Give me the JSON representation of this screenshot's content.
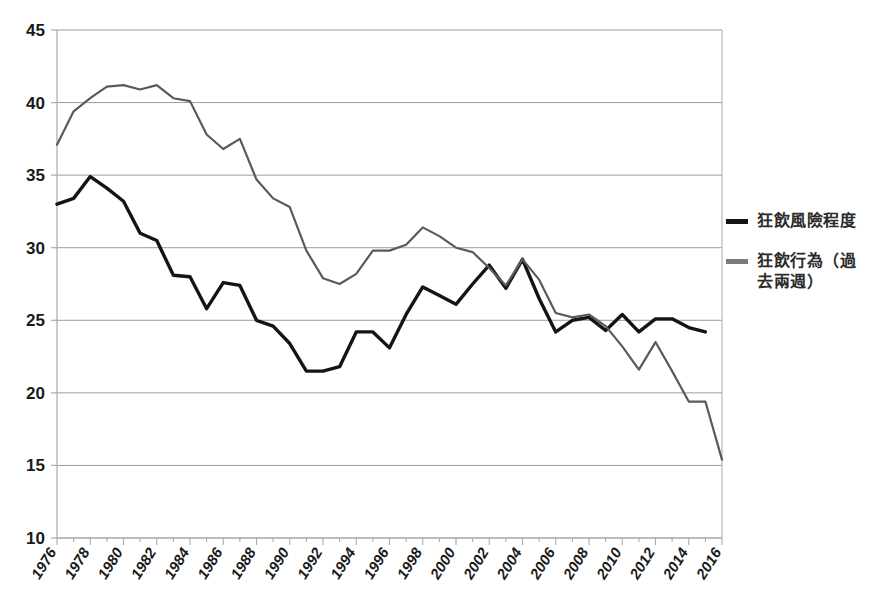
{
  "chart_data": {
    "type": "line",
    "title": "",
    "subtitle": "",
    "xlabel": "",
    "ylabel": "",
    "ylim": [
      10,
      45
    ],
    "ytick_step": 5,
    "yticks": [
      10,
      15,
      20,
      25,
      30,
      35,
      40,
      45
    ],
    "grid": true,
    "grid_axis": "y",
    "legend_position": "right",
    "x": [
      1976,
      1977,
      1978,
      1979,
      1980,
      1981,
      1982,
      1983,
      1984,
      1985,
      1986,
      1987,
      1988,
      1989,
      1990,
      1991,
      1992,
      1993,
      1994,
      1995,
      1996,
      1997,
      1998,
      1999,
      2000,
      2001,
      2002,
      2003,
      2004,
      2005,
      2006,
      2007,
      2008,
      2009,
      2010,
      2011,
      2012,
      2013,
      2014,
      2015,
      2016
    ],
    "xtick_labels": [
      "1976",
      "1978",
      "1980",
      "1982",
      "1984",
      "1986",
      "1988",
      "1990",
      "1992",
      "1994",
      "1996",
      "1998",
      "2000",
      "2002",
      "2004",
      "2006",
      "2008",
      "2010",
      "2012",
      "2014",
      "2016"
    ],
    "xtick_step": 2,
    "minor_ticks_every": 1,
    "series": [
      {
        "name": "狂飲風險程度",
        "color": "#141414",
        "width": 3.4,
        "values": [
          33.0,
          33.4,
          34.9,
          34.1,
          33.2,
          31.0,
          30.5,
          28.1,
          28.0,
          25.8,
          27.6,
          27.4,
          25.0,
          24.6,
          23.4,
          21.5,
          21.5,
          21.8,
          24.2,
          24.2,
          23.1,
          25.4,
          27.3,
          26.7,
          26.1,
          27.5,
          28.8,
          27.2,
          29.2,
          26.5,
          24.2,
          25.0,
          25.2,
          24.3,
          25.4,
          24.2,
          25.1,
          25.1,
          24.5,
          24.2,
          null
        ]
      },
      {
        "name": "狂飲行為（過去兩週）",
        "color": "#5a5a5a",
        "width": 2.2,
        "values": [
          37.1,
          39.4,
          40.3,
          41.1,
          41.2,
          40.9,
          41.2,
          40.3,
          40.1,
          37.8,
          36.8,
          37.5,
          34.7,
          33.4,
          32.8,
          29.8,
          27.9,
          27.5,
          28.2,
          29.8,
          29.8,
          30.2,
          31.4,
          30.8,
          30.0,
          29.7,
          28.6,
          27.4,
          29.2,
          27.8,
          25.5,
          25.2,
          25.4,
          24.6,
          23.2,
          21.6,
          23.5,
          21.5,
          19.4,
          19.4,
          15.4
        ]
      }
    ]
  },
  "legend": {
    "items": [
      {
        "label": "狂飲風險程度",
        "color": "#141414"
      },
      {
        "label": "狂飲行為（過\n去兩週）",
        "color": "#7a7a7a"
      }
    ]
  },
  "axes": {
    "plot_left_px": 57,
    "plot_right_px": 722,
    "plot_top_px": 30,
    "plot_bottom_px": 538,
    "axis_color": "#aaaaaa",
    "grid_color": "#9c9c9c"
  }
}
